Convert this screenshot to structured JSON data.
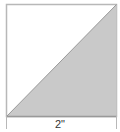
{
  "diagram": {
    "dimension_label": "2\"",
    "colors": {
      "outline": "#b8b8b8",
      "shaded": "#c9c9c9",
      "diagonal": "#9a9a9a",
      "background": "#ffffff"
    }
  }
}
